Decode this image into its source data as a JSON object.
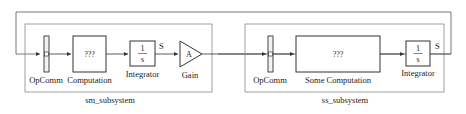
{
  "diagram": {
    "subsystems": [
      {
        "name": "sm_subsystem",
        "blocks": [
          {
            "type": "opcomm",
            "label": "OpComm"
          },
          {
            "type": "block",
            "label": "Computation",
            "content": "???"
          },
          {
            "type": "integrator",
            "label": "Integrator",
            "numerator": "1",
            "denominator": "s",
            "output_signal": "S"
          },
          {
            "type": "gain",
            "label": "Gain",
            "content": "A"
          }
        ]
      },
      {
        "name": "ss_subsystem",
        "blocks": [
          {
            "type": "opcomm",
            "label": "OpComm"
          },
          {
            "type": "block",
            "label": "Some Computation",
            "content": "???"
          },
          {
            "type": "integrator",
            "label": "Integrator",
            "numerator": "1",
            "denominator": "s",
            "output_signal": "S"
          }
        ]
      }
    ],
    "colors": {
      "line": "#333333",
      "subsystem_border": "#777777",
      "opcomm_fill": "#f2f2f2"
    }
  }
}
